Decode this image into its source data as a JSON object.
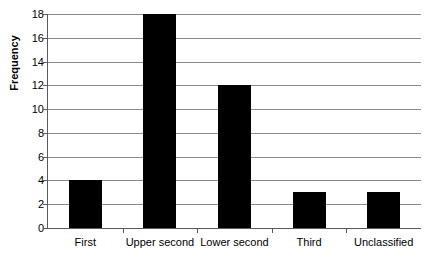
{
  "chart_data": {
    "type": "bar",
    "title": "",
    "subtitle": "",
    "xlabel": "",
    "ylabel": "Frequency",
    "categories": [
      "First",
      "Upper second",
      "Lower second",
      "Third",
      "Unclassified"
    ],
    "values": [
      4,
      18,
      12,
      3,
      3
    ],
    "ylim": [
      0,
      18
    ],
    "ytick_step": 2,
    "yticks": [
      18,
      16,
      14,
      12,
      10,
      8,
      6,
      4,
      2,
      0
    ],
    "grid": true,
    "grid_axis": "y",
    "legend": false,
    "legend_position": "none",
    "bar_color": "#000000",
    "grid_color": "#8a8a8a",
    "axis_color": "#5a5a5a",
    "background_color": "#ffffff"
  }
}
